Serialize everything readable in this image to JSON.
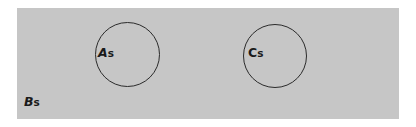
{
  "diagram": {
    "type": "set-diagram",
    "title": "",
    "universe": {
      "name": "universe-set",
      "label_main": "B",
      "label_sub": "s",
      "label_full": "Bs",
      "fill_color": "#c6c6c6",
      "italic_main": true
    },
    "sets": [
      {
        "name": "set-a",
        "label_main": "A",
        "label_sub": "s",
        "label_full": "As",
        "shape": "circle",
        "stroke_color": "#2b2b2b",
        "fill_color": "transparent",
        "italic_main": true
      },
      {
        "name": "set-c",
        "label_main": "C",
        "label_sub": "s",
        "label_full": "Cs",
        "shape": "circle",
        "stroke_color": "#2b2b2b",
        "fill_color": "transparent",
        "italic_main": false
      }
    ],
    "relations": "disjoint subsets of universe"
  },
  "page": {
    "background_color": "#ffffff"
  }
}
